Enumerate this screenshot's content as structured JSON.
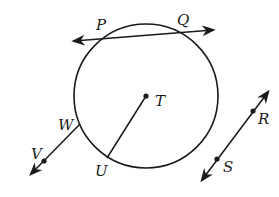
{
  "diagram": {
    "type": "circle-geometry",
    "circle": {
      "center_label": "T"
    },
    "labels": {
      "P": "P",
      "Q": "Q",
      "T": "T",
      "W": "W",
      "V": "V",
      "U": "U",
      "R": "R",
      "S": "S"
    },
    "elements": [
      {
        "kind": "secant-line",
        "through": [
          "P",
          "Q"
        ]
      },
      {
        "kind": "radius",
        "from": "T",
        "to": "U"
      },
      {
        "kind": "ray-or-line",
        "through": [
          "W",
          "V"
        ]
      },
      {
        "kind": "line",
        "through": [
          "R",
          "S"
        ]
      }
    ]
  }
}
